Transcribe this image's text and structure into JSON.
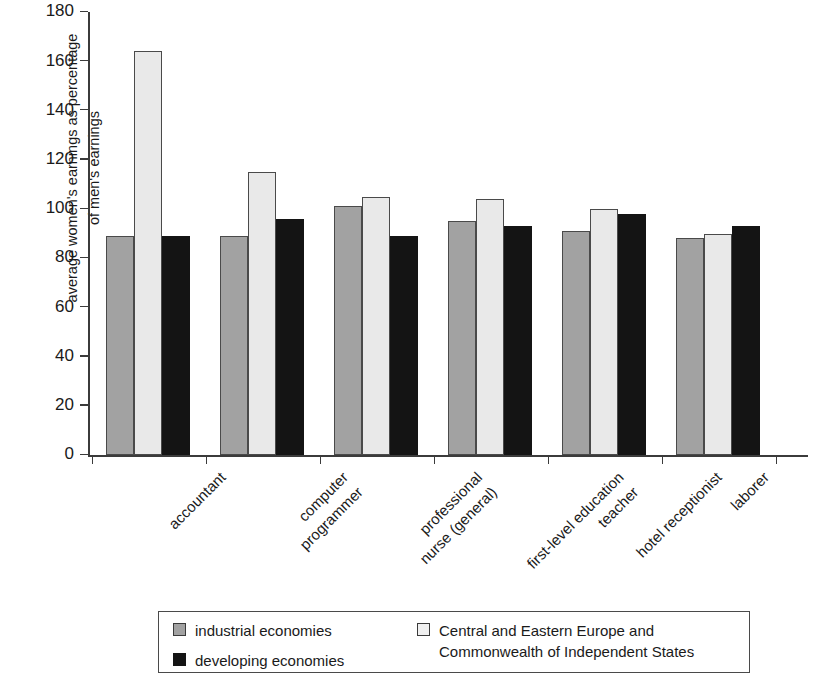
{
  "chart_data": {
    "type": "bar",
    "title": "",
    "xlabel": "",
    "ylabel": "average women's earnings as percentage of men's earnings",
    "ylabel_lines": [
      "average women's earnings as percentage",
      "of men's earnings"
    ],
    "ylim": [
      0,
      180
    ],
    "yticks": [
      0,
      20,
      40,
      60,
      80,
      100,
      120,
      140,
      160,
      180
    ],
    "ytick_labels": [
      "0",
      "20",
      "40",
      "60",
      "80",
      "100",
      "120",
      "140",
      "160",
      "180"
    ],
    "grid": false,
    "legend_position": "bottom",
    "categories": [
      "accountant",
      "computer programmer",
      "professional nurse (general)",
      "first-level education teacher",
      "hotel receptionist",
      "laborer"
    ],
    "category_label_lines": [
      [
        "accountant"
      ],
      [
        "computer",
        "programmer"
      ],
      [
        "professional",
        "nurse (general)"
      ],
      [
        "first-level education",
        "teacher"
      ],
      [
        "hotel receptionist"
      ],
      [
        "laborer"
      ]
    ],
    "series": [
      {
        "name": "industrial economies",
        "name_lines": [
          "industrial economies"
        ],
        "color": "#a2a2a2",
        "values": [
          89,
          89,
          101,
          95,
          91,
          88
        ]
      },
      {
        "name": "Central and Eastern Europe and Commonwealth of Independent States",
        "name_lines": [
          "Central and Eastern Europe and",
          "Commonwealth of Independent States"
        ],
        "color": "#e9e9e9",
        "values": [
          164,
          115,
          105,
          104,
          100,
          90
        ]
      },
      {
        "name": "developing economies",
        "name_lines": [
          "developing economies"
        ],
        "color": "#141414",
        "values": [
          89,
          96,
          89,
          93,
          98,
          93
        ]
      }
    ]
  },
  "legend": {
    "left_items": [
      {
        "label": "industrial economies",
        "swatch": "industrial"
      },
      {
        "label": "developing economies",
        "swatch": "developing"
      }
    ],
    "right_items": [
      {
        "label": "Central and Eastern Europe and Commonwealth of Independent States",
        "swatch": "cee"
      }
    ]
  },
  "colors": {
    "industrial": "#a2a2a2",
    "cee": "#e9e9e9",
    "developing": "#141414",
    "axis": "#3b3b3b",
    "text": "#1a1a1a",
    "background": "#ffffff"
  }
}
